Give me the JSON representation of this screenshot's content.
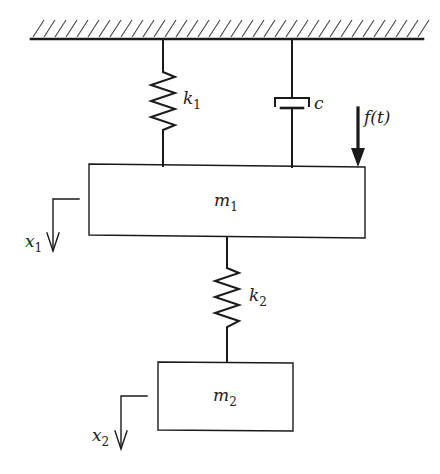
{
  "diagram": {
    "colors": {
      "ink": "#1a1a1a",
      "background": "#ffffff"
    },
    "ground": {
      "x1": 31,
      "x2": 423,
      "y": 39,
      "hatch_spacing": 11,
      "hatch_height": 17
    },
    "elements": {
      "spring_k1": {
        "label": "k",
        "subscript": "1",
        "x": 163,
        "top": 39,
        "bottom": 166
      },
      "damper_c": {
        "label": "c",
        "x": 292,
        "top": 39,
        "bottom": 167
      },
      "force": {
        "label": "f(t)",
        "x": 358,
        "top": 108,
        "bottom": 166
      },
      "mass_m1": {
        "label": "m",
        "subscript": "1",
        "x": 89,
        "y": 165,
        "width": 276,
        "height": 71
      },
      "spring_k2": {
        "label": "k",
        "subscript": "2",
        "x": 227,
        "top": 237,
        "bottom": 362
      },
      "mass_m2": {
        "label": "m",
        "subscript": "2",
        "x": 158,
        "y": 362,
        "width": 135,
        "height": 68
      },
      "disp_x1": {
        "label": "x",
        "subscript": "1",
        "x": 53,
        "y": 199,
        "bottom": 251,
        "ref_end": 79
      },
      "disp_x2": {
        "label": "x",
        "subscript": "2",
        "x": 121,
        "y": 396,
        "bottom": 449,
        "ref_end": 147
      }
    }
  }
}
